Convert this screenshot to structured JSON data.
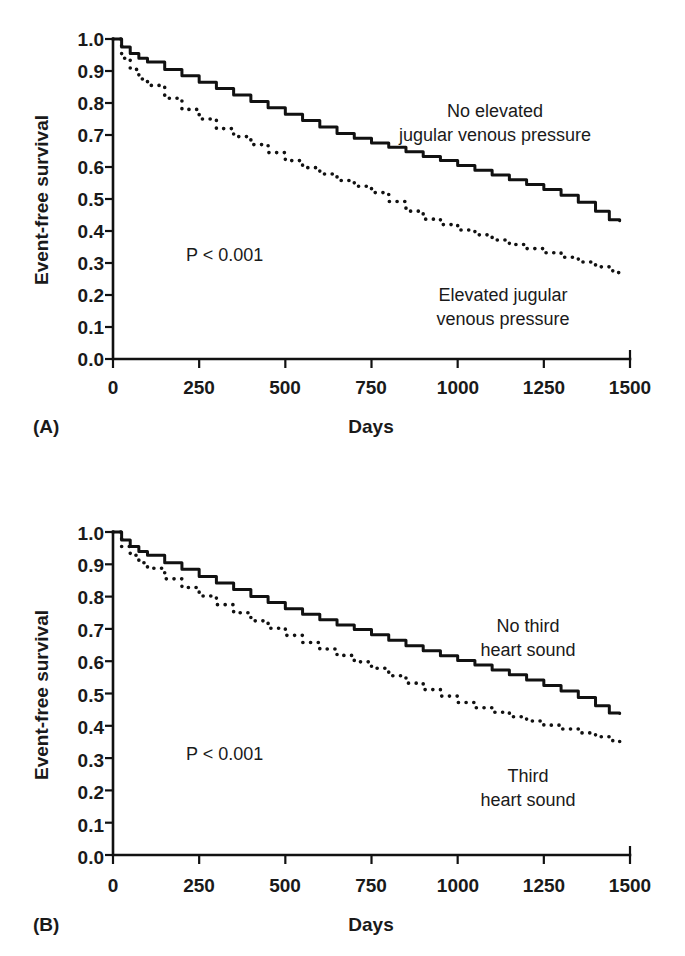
{
  "figure": {
    "background_color": "#ffffff",
    "ink_color": "#111111"
  },
  "panels": [
    {
      "id": "A",
      "letter": "(A)",
      "xlabel": "Days",
      "ylabel": "Event-free survival",
      "pvalue": "P < 0.001",
      "annotations": [
        {
          "id": "upper",
          "line1": "No elevated",
          "line2": "jugular venous pressure"
        },
        {
          "id": "lower",
          "line1": "Elevated jugular",
          "line2": "venous pressure"
        }
      ],
      "xticks": [
        "0",
        "250",
        "500",
        "750",
        "1000",
        "1250",
        "1500"
      ],
      "yticks": [
        "1.0",
        "0.9",
        "0.8",
        "0.7",
        "0.6",
        "0.5",
        "0.4",
        "0.3",
        "0.2",
        "0.1",
        "0.0"
      ]
    },
    {
      "id": "B",
      "letter": "(B)",
      "xlabel": "Days",
      "ylabel": "Event-free survival",
      "pvalue": "P < 0.001",
      "annotations": [
        {
          "id": "upper",
          "line1": "No third",
          "line2": "heart sound"
        },
        {
          "id": "lower",
          "line1": "Third",
          "line2": "heart sound"
        }
      ],
      "xticks": [
        "0",
        "250",
        "500",
        "750",
        "1000",
        "1250",
        "1500"
      ],
      "yticks": [
        "1.0",
        "0.9",
        "0.8",
        "0.7",
        "0.6",
        "0.5",
        "0.4",
        "0.3",
        "0.2",
        "0.1",
        "0.0"
      ]
    }
  ],
  "chart_data": [
    {
      "panel": "A",
      "type": "line",
      "title": "",
      "xlabel": "Days",
      "ylabel": "Event-free survival",
      "xlim": [
        0,
        1500
      ],
      "ylim": [
        0,
        1.0
      ],
      "xticks": [
        0,
        250,
        500,
        750,
        1000,
        1250,
        1500
      ],
      "yticks": [
        0.0,
        0.1,
        0.2,
        0.3,
        0.4,
        0.5,
        0.6,
        0.7,
        0.8,
        0.9,
        1.0
      ],
      "grid": false,
      "legend_position": "inline-annotation",
      "annotation_text": "P < 0.001",
      "series": [
        {
          "name": "No elevated jugular venous pressure",
          "style": "solid",
          "x": [
            0,
            25,
            50,
            75,
            100,
            150,
            200,
            250,
            300,
            350,
            400,
            450,
            500,
            550,
            600,
            650,
            700,
            750,
            800,
            850,
            900,
            950,
            1000,
            1050,
            1100,
            1150,
            1200,
            1250,
            1300,
            1350,
            1400,
            1440,
            1470
          ],
          "y": [
            1.0,
            0.975,
            0.955,
            0.94,
            0.928,
            0.905,
            0.885,
            0.865,
            0.845,
            0.825,
            0.805,
            0.785,
            0.765,
            0.745,
            0.725,
            0.705,
            0.69,
            0.675,
            0.662,
            0.648,
            0.633,
            0.62,
            0.605,
            0.59,
            0.575,
            0.56,
            0.545,
            0.53,
            0.512,
            0.49,
            0.462,
            0.435,
            0.432
          ]
        },
        {
          "name": "Elevated jugular venous pressure",
          "style": "dotted",
          "x": [
            0,
            25,
            50,
            75,
            100,
            150,
            200,
            250,
            300,
            350,
            400,
            450,
            500,
            550,
            600,
            650,
            700,
            750,
            800,
            850,
            900,
            950,
            1000,
            1050,
            1100,
            1150,
            1200,
            1250,
            1300,
            1350,
            1400,
            1450,
            1470
          ],
          "y": [
            1.0,
            0.94,
            0.905,
            0.875,
            0.855,
            0.815,
            0.78,
            0.75,
            0.72,
            0.695,
            0.67,
            0.645,
            0.62,
            0.598,
            0.578,
            0.558,
            0.54,
            0.52,
            0.492,
            0.462,
            0.437,
            0.42,
            0.403,
            0.388,
            0.372,
            0.358,
            0.345,
            0.332,
            0.318,
            0.303,
            0.288,
            0.27,
            0.262
          ]
        }
      ]
    },
    {
      "panel": "B",
      "type": "line",
      "title": "",
      "xlabel": "Days",
      "ylabel": "Event-free survival",
      "xlim": [
        0,
        1500
      ],
      "ylim": [
        0,
        1.0
      ],
      "xticks": [
        0,
        250,
        500,
        750,
        1000,
        1250,
        1500
      ],
      "yticks": [
        0.0,
        0.1,
        0.2,
        0.3,
        0.4,
        0.5,
        0.6,
        0.7,
        0.8,
        0.9,
        1.0
      ],
      "grid": false,
      "legend_position": "inline-annotation",
      "annotation_text": "P < 0.001",
      "series": [
        {
          "name": "No third heart sound",
          "style": "solid",
          "x": [
            0,
            25,
            50,
            75,
            100,
            150,
            200,
            250,
            300,
            350,
            400,
            450,
            500,
            550,
            600,
            650,
            700,
            750,
            800,
            850,
            900,
            950,
            1000,
            1050,
            1100,
            1150,
            1200,
            1250,
            1300,
            1350,
            1400,
            1440,
            1470
          ],
          "y": [
            1.0,
            0.975,
            0.955,
            0.94,
            0.928,
            0.905,
            0.885,
            0.862,
            0.842,
            0.822,
            0.8,
            0.782,
            0.762,
            0.745,
            0.728,
            0.712,
            0.698,
            0.682,
            0.665,
            0.648,
            0.632,
            0.617,
            0.602,
            0.588,
            0.573,
            0.558,
            0.542,
            0.525,
            0.508,
            0.488,
            0.462,
            0.44,
            0.438
          ]
        },
        {
          "name": "Third heart sound",
          "style": "dotted",
          "x": [
            0,
            25,
            50,
            75,
            100,
            150,
            200,
            250,
            300,
            350,
            400,
            450,
            500,
            550,
            600,
            650,
            700,
            750,
            800,
            850,
            900,
            950,
            1000,
            1050,
            1100,
            1150,
            1200,
            1250,
            1300,
            1350,
            1400,
            1450,
            1470
          ],
          "y": [
            1.0,
            0.955,
            0.928,
            0.905,
            0.888,
            0.855,
            0.828,
            0.802,
            0.775,
            0.75,
            0.725,
            0.702,
            0.68,
            0.658,
            0.638,
            0.618,
            0.598,
            0.578,
            0.555,
            0.532,
            0.512,
            0.492,
            0.472,
            0.456,
            0.442,
            0.428,
            0.415,
            0.402,
            0.39,
            0.378,
            0.366,
            0.353,
            0.348
          ]
        }
      ]
    }
  ]
}
